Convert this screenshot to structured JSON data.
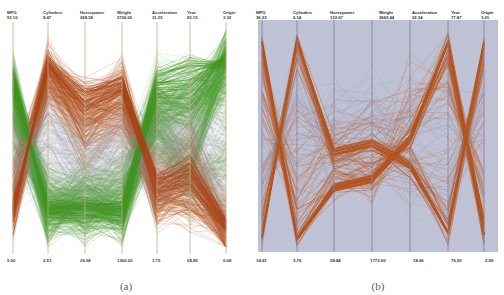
{
  "figure": {
    "caption_a": "(a)",
    "caption_b": "(b)"
  },
  "panel_a": {
    "id": "a",
    "background": "#ffffff",
    "axis_color": "#c8a878",
    "line_colors": [
      "#4a9a30",
      "#b4531e",
      "#9a9aa8"
    ],
    "axes": [
      {
        "name": "MPG",
        "top": "52.10",
        "bottom": "5.50"
      },
      {
        "name": "Cylinders",
        "top": "8.47",
        "bottom": "2.53"
      },
      {
        "name": "Horsepower",
        "top": "268.58",
        "bottom": "29.58"
      },
      {
        "name": "Weight",
        "top": "5700.00",
        "bottom": "1300.00"
      },
      {
        "name": "Acceleration",
        "top": "31.25",
        "bottom": "3.75"
      },
      {
        "name": "Year",
        "top": "83.15",
        "bottom": "68.85"
      },
      {
        "name": "Origin",
        "top": "3.32",
        "bottom": "0.68"
      }
    ]
  },
  "panel_b": {
    "id": "b",
    "background": "#bfc2d4",
    "axis_color": "#8f7f9f",
    "line_colors": [
      "#b4531e",
      "#8f8faa"
    ],
    "axes": [
      {
        "name": "MPG",
        "top": "36.23",
        "bottom": "14.91"
      },
      {
        "name": "Cylinders",
        "top": "6.14",
        "bottom": "3.76"
      },
      {
        "name": "Horsepower",
        "top": "132.67",
        "bottom": "58.84"
      },
      {
        "name": "Weight",
        "top": "3662.44",
        "bottom": "1773.00"
      },
      {
        "name": "Acceleration",
        "top": "22.34",
        "bottom": "18.96"
      },
      {
        "name": "Year",
        "top": "77.87",
        "bottom": "76.93"
      },
      {
        "name": "Origin",
        "top": "1.01",
        "bottom": "0.99"
      }
    ]
  },
  "chart_data": {
    "type": "line",
    "subtype": "parallel-coordinates",
    "title": "",
    "panels": [
      {
        "label": "(a)",
        "description": "Full automobile dataset rendered as parallel coordinates on white background with green, brown and grey polylines.",
        "dimensions": [
          "MPG",
          "Cylinders",
          "Horsepower",
          "Weight",
          "Acceleration",
          "Year",
          "Origin"
        ],
        "axis_ranges": [
          [
            5.5,
            52.1
          ],
          [
            2.53,
            8.47
          ],
          [
            29.58,
            268.58
          ],
          [
            1300.0,
            5700.0
          ],
          [
            3.75,
            31.25
          ],
          [
            68.85,
            83.15
          ],
          [
            0.68,
            3.32
          ]
        ],
        "grid": false,
        "legend": "none"
      },
      {
        "label": "(b)",
        "description": "Selected cluster subset rendered as parallel coordinates on blue-grey background with brown polylines; axis ranges are narrowed to the cluster extent.",
        "dimensions": [
          "MPG",
          "Cylinders",
          "Horsepower",
          "Weight",
          "Acceleration",
          "Year",
          "Origin"
        ],
        "axis_ranges": [
          [
            14.91,
            36.23
          ],
          [
            3.76,
            6.14
          ],
          [
            58.84,
            132.67
          ],
          [
            1773.0,
            3662.44
          ],
          [
            18.96,
            22.34
          ],
          [
            76.93,
            77.87
          ],
          [
            0.99,
            1.01
          ]
        ],
        "grid": false,
        "legend": "none"
      }
    ]
  }
}
